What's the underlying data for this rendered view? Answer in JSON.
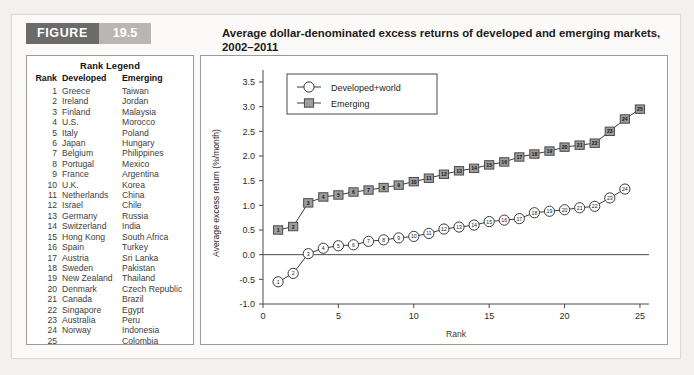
{
  "figure": {
    "tag_word": "FIGURE",
    "tag_number": "19.5",
    "title": "Average dollar-denominated excess returns of developed and emerging markets, 2002–2011"
  },
  "rank_legend": {
    "title": "Rank Legend",
    "headers": [
      "Rank",
      "Developed",
      "Emerging"
    ],
    "rows": [
      [
        "1",
        "Greece",
        "Taiwan"
      ],
      [
        "2",
        "Ireland",
        "Jordan"
      ],
      [
        "3",
        "Finland",
        "Malaysia"
      ],
      [
        "4",
        "U.S.",
        "Morocco"
      ],
      [
        "5",
        "Italy",
        "Poland"
      ],
      [
        "6",
        "Japan",
        "Hungary"
      ],
      [
        "7",
        "Belgium",
        "Philippines"
      ],
      [
        "8",
        "Portugal",
        "Mexico"
      ],
      [
        "9",
        "France",
        "Argentina"
      ],
      [
        "10",
        "U.K.",
        "Korea"
      ],
      [
        "11",
        "Netherlands",
        "China"
      ],
      [
        "12",
        "Israel",
        "Chile"
      ],
      [
        "13",
        "Germany",
        "Russia"
      ],
      [
        "14",
        "Switzerland",
        "India"
      ],
      [
        "15",
        "Hong Kong",
        "South Africa"
      ],
      [
        "16",
        "Spain",
        "Turkey"
      ],
      [
        "17",
        "Austria",
        "Sri Lanka"
      ],
      [
        "18",
        "Sweden",
        "Pakistan"
      ],
      [
        "19",
        "New Zealand",
        "Thailand"
      ],
      [
        "20",
        "Denmark",
        "Czech Republic"
      ],
      [
        "21",
        "Canada",
        "Brazil"
      ],
      [
        "22",
        "Singapore",
        "Egypt"
      ],
      [
        "23",
        "Australia",
        "Peru"
      ],
      [
        "24",
        "Norway",
        "Indonesia"
      ],
      [
        "25",
        "",
        "Colombia"
      ]
    ]
  },
  "chart_data": {
    "type": "line",
    "title": "",
    "xlabel": "Rank",
    "ylabel": "Average excess return (%/month)",
    "caption": "Markets are sorted by average returns, from low to high",
    "xlim": [
      0,
      25.6
    ],
    "ylim": [
      -1.0,
      3.5
    ],
    "xticks": [
      0,
      5,
      10,
      15,
      20,
      25
    ],
    "xticklabels": [
      "0",
      "5",
      "10",
      "15",
      "20",
      "25"
    ],
    "yticks": [
      -1.0,
      -0.5,
      0.0,
      0.5,
      1.0,
      1.5,
      2.0,
      2.5,
      3.0,
      3.5
    ],
    "yticklabels": [
      "-1.0",
      "-0.5",
      "0.0",
      "0.5",
      "1.0",
      "1.5",
      "2.0",
      "2.5",
      "3.0",
      "3.5"
    ],
    "grid": false,
    "zero_line": true,
    "legend_position": "top-left",
    "series": [
      {
        "name": "Developed+world",
        "marker": "circle",
        "x": [
          1,
          2,
          3,
          4,
          5,
          6,
          7,
          8,
          9,
          10,
          11,
          12,
          13,
          14,
          15,
          16,
          17,
          18,
          19,
          20,
          21,
          22,
          23,
          24
        ],
        "values": [
          -0.55,
          -0.38,
          0.02,
          0.13,
          0.18,
          0.2,
          0.27,
          0.3,
          0.34,
          0.37,
          0.43,
          0.52,
          0.56,
          0.6,
          0.67,
          0.7,
          0.73,
          0.85,
          0.88,
          0.91,
          0.95,
          0.98,
          1.15,
          1.33
        ]
      },
      {
        "name": "Emerging",
        "marker": "square",
        "x": [
          1,
          2,
          3,
          4,
          5,
          6,
          7,
          8,
          9,
          10,
          11,
          12,
          13,
          14,
          15,
          16,
          17,
          18,
          19,
          20,
          21,
          22,
          23,
          24,
          25
        ],
        "values": [
          0.5,
          0.57,
          1.05,
          1.17,
          1.21,
          1.27,
          1.31,
          1.36,
          1.41,
          1.48,
          1.55,
          1.63,
          1.7,
          1.75,
          1.82,
          1.88,
          1.98,
          2.04,
          2.1,
          2.18,
          2.22,
          2.26,
          2.5,
          2.75,
          2.95
        ]
      }
    ]
  }
}
